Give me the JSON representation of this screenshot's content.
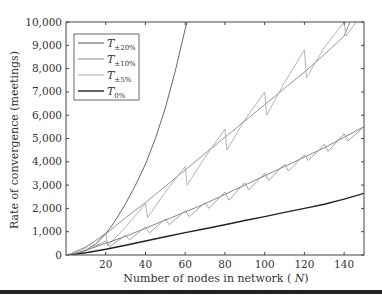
{
  "chart_data": {
    "type": "line",
    "title": "",
    "xlabel": "Number of nodes in network (N)",
    "ylabel": "Rate of convergence (meetings)",
    "xlim": [
      0,
      150
    ],
    "ylim": [
      0,
      10000
    ],
    "xticks": [
      20,
      40,
      60,
      80,
      100,
      120,
      140
    ],
    "yticks": [
      0,
      1000,
      2000,
      3000,
      4000,
      5000,
      6000,
      7000,
      8000,
      9000,
      10000
    ],
    "ytick_labels": [
      "0",
      "1,000",
      "2,000",
      "3,000",
      "4,000",
      "5,000",
      "6,000",
      "7,000",
      "8,000",
      "9,000",
      "10,000"
    ],
    "grid": false,
    "legend_position": "upper left",
    "series": [
      {
        "name": "T±20%",
        "legend_main": "T",
        "legend_sub": "±20%",
        "color": "#555555",
        "x": [
          1,
          5,
          10,
          15,
          20,
          25,
          30,
          35,
          40,
          45,
          50,
          55,
          60,
          61
        ],
        "y": [
          0,
          40,
          200,
          480,
          900,
          1500,
          2200,
          3000,
          3900,
          5000,
          6300,
          7900,
          9700,
          10000
        ]
      },
      {
        "name": "T±10%",
        "legend_main": "T",
        "legend_sub": "±10%",
        "color": "#888888",
        "x": [
          1,
          10,
          20,
          30,
          40,
          50,
          60,
          70,
          80,
          90,
          100,
          110,
          120,
          130,
          140,
          143
        ],
        "y": [
          0,
          350,
          900,
          1600,
          2250,
          2950,
          3650,
          4350,
          5050,
          5750,
          6450,
          7150,
          7850,
          8600,
          9400,
          10000
        ]
      },
      {
        "name": "T±5%",
        "legend_main": "T",
        "legend_sub": "±5%",
        "color": "#aaaaaa",
        "x": [
          1,
          10,
          20,
          21,
          30,
          40,
          41,
          50,
          60,
          61,
          70,
          80,
          81,
          90,
          100,
          101,
          110,
          120,
          121,
          130,
          140,
          141,
          146
        ],
        "y": [
          0,
          300,
          950,
          400,
          1200,
          2200,
          1600,
          2700,
          3800,
          3000,
          4200,
          5400,
          4500,
          5800,
          7000,
          6000,
          7400,
          8800,
          7600,
          8900,
          10000,
          9400,
          10000
        ]
      },
      {
        "name": "T0%",
        "legend_main": "T",
        "legend_sub": "0%",
        "color": "#222222",
        "x": [
          1,
          10,
          20,
          30,
          40,
          50,
          60,
          70,
          80,
          90,
          100,
          110,
          120,
          130,
          140,
          150
        ],
        "y": [
          0,
          100,
          250,
          420,
          600,
          780,
          960,
          1130,
          1300,
          1480,
          1650,
          1830,
          2000,
          2180,
          2400,
          2650
        ]
      },
      {
        "name": "Unlabeled (mid pair, smooth)",
        "color": "#777777",
        "x": [
          1,
          10,
          20,
          30,
          40,
          50,
          60,
          70,
          80,
          90,
          100,
          110,
          120,
          130,
          140,
          150
        ],
        "y": [
          0,
          200,
          500,
          800,
          1150,
          1500,
          1850,
          2200,
          2600,
          3000,
          3400,
          3800,
          4200,
          4600,
          5050,
          5500
        ]
      },
      {
        "name": "Unlabeled (mid pair, sawtooth)",
        "color": "#999999",
        "x": [
          1,
          10,
          20,
          22,
          30,
          32,
          40,
          42,
          50,
          52,
          60,
          62,
          70,
          72,
          80,
          82,
          90,
          92,
          100,
          102,
          110,
          112,
          120,
          122,
          130,
          132,
          140,
          142,
          150
        ],
        "y": [
          0,
          180,
          600,
          350,
          850,
          650,
          1200,
          950,
          1550,
          1300,
          1900,
          1650,
          2250,
          2000,
          2700,
          2350,
          3100,
          2800,
          3500,
          3200,
          3900,
          3600,
          4300,
          4050,
          4750,
          4450,
          5200,
          4900,
          5500
        ]
      }
    ]
  }
}
